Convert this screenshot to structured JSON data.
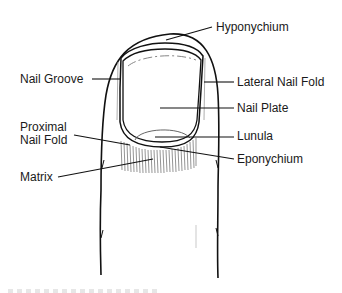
{
  "diagram": {
    "labels": {
      "hyponychium": "Hyponychium",
      "nail_groove": "Nail Groove",
      "lateral_nail_fold": "Lateral Nail Fold",
      "nail_plate": "Nail Plate",
      "proximal_nail_fold_line1": "Proximal",
      "proximal_nail_fold_line2": "Nail Fold",
      "lunula": "Lunula",
      "eponychium": "Eponychium",
      "matrix": "Matrix"
    },
    "colors": {
      "line": "#111111",
      "text": "#1a1a1a",
      "hatch": "#555555",
      "background": "#ffffff"
    }
  }
}
